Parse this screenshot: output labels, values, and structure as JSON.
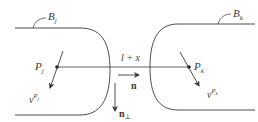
{
  "diagram": {
    "bodies": [
      {
        "id": "B_j",
        "label": "B",
        "subscript": "j"
      },
      {
        "id": "B_k",
        "label": "B",
        "subscript": "k"
      }
    ],
    "points": [
      {
        "id": "P_j",
        "label": "P",
        "subscript": "j"
      },
      {
        "id": "P_k",
        "label": "P",
        "subscript": "k"
      }
    ],
    "velocities": [
      {
        "id": "v_Pj",
        "label": "ν",
        "superscript": "P",
        "sub_of_super": "j"
      },
      {
        "id": "v_Pk",
        "label": "ν",
        "superscript": "P",
        "sub_of_super": "k"
      }
    ],
    "distance_label": "l + x",
    "normal": {
      "label": "n"
    },
    "normal_perp": {
      "label": "n",
      "subscript": "⊥"
    },
    "colors": {
      "stroke": "#3a3a3a",
      "background": "#ffffff"
    }
  }
}
